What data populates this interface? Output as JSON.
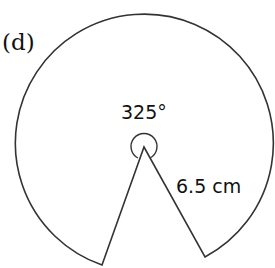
{
  "figure": {
    "part_label": "(d)",
    "shape": "sector (major)",
    "angle_label": "325°",
    "radius_label": "6.5 cm",
    "angle_degrees": 325,
    "radius_cm": 6.5
  },
  "colors": {
    "stroke": "#333333",
    "text": "#111111",
    "background": "#ffffff"
  }
}
